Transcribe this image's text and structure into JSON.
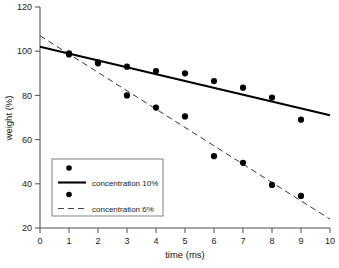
{
  "chart_data": {
    "type": "scatter",
    "title": "",
    "xlabel": "time (ms)",
    "ylabel": "weight (%)",
    "xlim": [
      0,
      10
    ],
    "ylim": [
      20,
      120
    ],
    "xticks": [
      0,
      1,
      2,
      3,
      4,
      5,
      6,
      7,
      8,
      9,
      10
    ],
    "yticks": [
      20,
      40,
      60,
      80,
      100,
      120
    ],
    "xtick_labels": [
      "0",
      "1",
      "2",
      "3",
      "4",
      "5",
      "6",
      "7",
      "8",
      "9",
      "10"
    ],
    "ytick_labels": [
      "20",
      "40",
      "60",
      "80",
      "100",
      "120"
    ],
    "grid": false,
    "legend_position": "lower-left",
    "series": [
      {
        "name": "concentration 10%",
        "marker": "filled-circle",
        "line_style": "solid",
        "color": "#000000",
        "x": [
          1,
          2,
          3,
          4,
          5,
          6,
          7,
          8,
          9
        ],
        "values": [
          99,
          95,
          93,
          91,
          90,
          86.5,
          83.5,
          79,
          69
        ],
        "trend_line": {
          "x": [
            0,
            10
          ],
          "y": [
            102,
            71
          ]
        }
      },
      {
        "name": "concentration 6%",
        "marker": "filled-circle",
        "line_style": "dashed",
        "color": "#000000",
        "x": [
          1,
          2,
          3,
          4,
          5,
          6,
          7,
          8,
          9
        ],
        "values": [
          98.5,
          94.5,
          80,
          74.5,
          70.5,
          52.5,
          49.5,
          39.5,
          34.5
        ],
        "trend_line": {
          "x": [
            0,
            10
          ],
          "y": [
            107,
            24
          ]
        }
      }
    ],
    "legend_entries": [
      {
        "label": "",
        "symbol": "marker",
        "style": "filled-circle"
      },
      {
        "label": "concentration 10%",
        "symbol": "line",
        "style": "solid"
      },
      {
        "label": "",
        "symbol": "marker",
        "style": "filled-circle"
      },
      {
        "label": "concentration 6%",
        "symbol": "line",
        "style": "dashed"
      }
    ]
  }
}
